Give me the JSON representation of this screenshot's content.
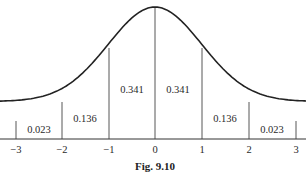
{
  "figure": {
    "caption": "Fig. 9.10",
    "type": "normal-distribution-curve"
  },
  "chart_data": {
    "type": "area",
    "title": "",
    "caption": "Fig. 9.10",
    "xlabel": "",
    "ylabel": "",
    "x_ticks": [
      "-3",
      "-2",
      "-1",
      "0",
      "1",
      "2",
      "3"
    ],
    "xlim": [
      -3,
      3
    ],
    "grid": false,
    "legend": null,
    "regions": [
      {
        "from": -3,
        "to": -2,
        "area": "0.023"
      },
      {
        "from": -2,
        "to": -1,
        "area": "0.136"
      },
      {
        "from": -1,
        "to": 0,
        "area": "0.341"
      },
      {
        "from": 0,
        "to": 1,
        "area": "0.341"
      },
      {
        "from": 1,
        "to": 2,
        "area": "0.136"
      },
      {
        "from": 2,
        "to": 3,
        "area": "0.023"
      }
    ],
    "curve": "standard normal density"
  }
}
